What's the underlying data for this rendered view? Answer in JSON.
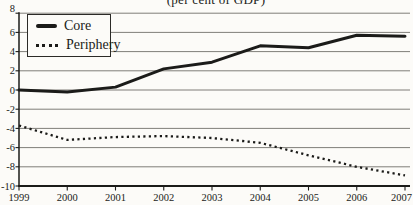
{
  "figure": {
    "title": "(per cent of GDP)",
    "background_color": "#fcfbf8",
    "note": "title is clipped at the top edge of the image"
  },
  "chart_data": {
    "type": "line",
    "title": "(per cent of GDP)",
    "categories": [
      "1999",
      "2000",
      "2001",
      "2002",
      "2003",
      "2004",
      "2005",
      "2006",
      "2007"
    ],
    "series": [
      {
        "name": "Core",
        "line_style": "solid",
        "values": [
          0.0,
          -0.2,
          0.3,
          2.2,
          2.9,
          4.6,
          4.4,
          5.7,
          5.6
        ]
      },
      {
        "name": "Periphery",
        "line_style": "dotted",
        "values": [
          -3.7,
          -5.2,
          -4.9,
          -4.8,
          -5.0,
          -5.5,
          -6.8,
          -8.0,
          -8.9
        ]
      }
    ],
    "ylim": [
      -10,
      8
    ],
    "yticks": [
      "8",
      "6",
      "4",
      "2",
      "0",
      "-2",
      "-4",
      "-6",
      "-8",
      "-10"
    ],
    "xticks": [
      "1999",
      "2000",
      "2001",
      "2002",
      "2003",
      "2004",
      "2005",
      "2006",
      "2007"
    ],
    "xlabel": "",
    "ylabel": "",
    "grid": "horizontal",
    "legend_position": "top-left",
    "line_color": "#1b1b19",
    "axis_color": "#1b1b19",
    "grid_color": "#56544f",
    "tick_font_size": 10.5
  }
}
